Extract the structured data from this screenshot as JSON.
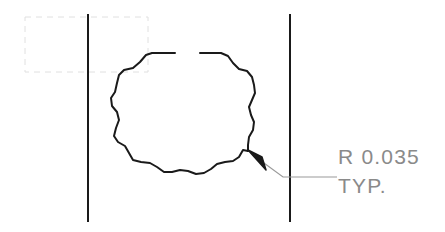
{
  "drawing": {
    "title": "engineering-detail-view",
    "background_color": "#ffffff",
    "line_color": "#1a1a1a",
    "construction_line_color": "#dcdcdc",
    "text_color": "#8a8a8a",
    "leader_line_color": "#9a9a9a",
    "annotations": [
      {
        "id": "radius-callout",
        "line1": "R 0.035",
        "line2": "TYP."
      }
    ],
    "callout": {
      "radius_label": "R 0.035",
      "typical_label": "TYP.",
      "text_x": 338,
      "line1_baseline_y": 164,
      "line2_baseline_y": 193
    },
    "vertical_lines": [
      {
        "name": "left-edge-line",
        "x": 88,
        "y1": 14,
        "y2": 222
      },
      {
        "name": "right-edge-line",
        "x": 290,
        "y1": 14,
        "y2": 222
      }
    ],
    "construction_rect": {
      "x": 25,
      "y": 17,
      "width": 123,
      "height": 55
    },
    "leader": {
      "arrow_tip_x": 248,
      "arrow_tip_y": 150,
      "elbow_x": 283,
      "elbow_y": 177,
      "end_x": 337,
      "end_y": 177
    },
    "polygon": {
      "name": "scalloped-polygon",
      "sides": 18,
      "center_x": 185,
      "center_y": 117,
      "outer_radius": 70,
      "gap_top": true,
      "points_segment_a": "M 175,53 L 152,53 L 146,55 L 140,62 L 133,68 L 124,70 L 119,75 L 117,83 L 115,92 L 111,98 L 112,106 L 117,112 L 119,120 L 116,128 L 114,136 L 118,142 L 125,146 L 129,153 L 133,160 L 141,162 L 150,163 L 157,167 L 164,172 L 172,172 L 180,170 L 188,171 L 196,174 L 204,173 L 211,169 L 217,164 L 225,162 L 233,161 L 239,157 L 243,150 L 248,151",
      "points_segment_b": "M 200,53 L 221,53 L 228,56 L 233,63 L 239,69 L 247,71 L 252,77 L 254,85 L 255,93 L 252,100 L 249,107 L 251,115 L 254,122 L 253,130 L 249,137 L 248,145 L 248,151"
    }
  }
}
